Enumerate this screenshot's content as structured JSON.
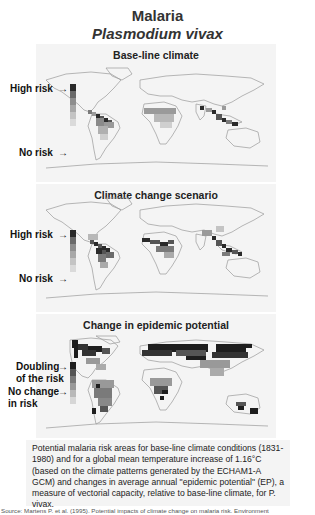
{
  "figure": {
    "title": "Malaria",
    "subtitle": "Plasmodium vivax"
  },
  "panels": [
    {
      "title": "Base-line climate",
      "legend_top": "High risk",
      "legend_bottom": "No risk",
      "legend_colors": [
        "#2a2a2a",
        "#6a6a6a",
        "#8e8e8e",
        "#a8a8a8",
        "#c4c4c4",
        "#dadada"
      ]
    },
    {
      "title": "Climate change scenario",
      "legend_top": "High risk",
      "legend_bottom": "No risk",
      "legend_colors": [
        "#2a2a2a",
        "#6a6a6a",
        "#8e8e8e",
        "#a8a8a8",
        "#c4c4c4",
        "#dadada"
      ]
    },
    {
      "title": "Change in epidemic potential",
      "legend_top": "Doubling of the risk",
      "legend_top_line1": "Doubling",
      "legend_top_line2": "of the risk",
      "legend_bottom_line1": "No change",
      "legend_bottom_line2": "in risk",
      "legend_colors": [
        "#1e1e1e",
        "#555555",
        "#7a7a7a",
        "#999999",
        "#b8b8b8",
        "#d6d6d6"
      ]
    }
  ],
  "caption": "Potential malaria risk areas for base-line climate conditions (1831-1980) and for a global mean temperature increase of 1.16°C (based on the climate patterns generated by the ECHAM1-A GCM) and changes in average annual \"epidemic potential\" (EP), a measure of vectorial capacity, relative to base-line climate, for P. vivax.",
  "source": "Source: Martens P. et al. (1995). Potential impacts of climate change on malaria risk. Environment"
}
